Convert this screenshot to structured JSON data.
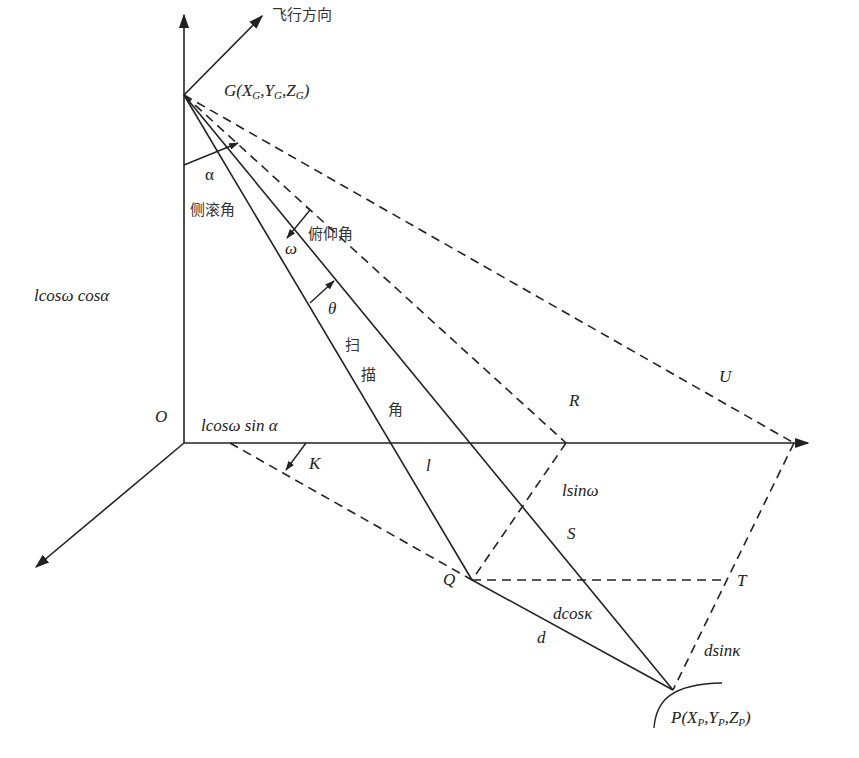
{
  "diagram": {
    "type": "3d-geometry-figure",
    "labels": {
      "flight_direction": "飞行方向",
      "point_G": "G(X",
      "G_sub_x": "G",
      "G_y": ",Y",
      "G_sub_y": "G",
      "G_z": ",Z",
      "G_sub_z": "G",
      "G_close": ")",
      "alpha": "α",
      "roll_angle": "侧滚角",
      "pitch_angle": "俯仰角",
      "omega": "ω",
      "theta": "θ",
      "scan_1": "扫",
      "scan_2": "描",
      "scan_3": "角",
      "vertical_len": "lcosω cosα",
      "origin": "O",
      "horizontal_len": "lcosω sin α",
      "K": "K",
      "l": "l",
      "R": "R",
      "U": "U",
      "lsin_omega": "lsinω",
      "S": "S",
      "Q": "Q",
      "T": "T",
      "dcos_kappa": "dcosκ",
      "d": "d",
      "dsin_kappa": "dsinκ",
      "point_P": "P(X",
      "P_sub_x": "P",
      "P_y": ",Y",
      "P_sub_y": "P",
      "P_z": ",Z",
      "P_sub_z": "P",
      "P_close": ")"
    },
    "points": {
      "G": [
        184,
        95
      ],
      "O": [
        184,
        443
      ],
      "x_axis_end": [
        808,
        443
      ],
      "z_axis_end": [
        184,
        15
      ],
      "y_axis_end": [
        35,
        568
      ],
      "flight_arrow_end": [
        262,
        15
      ],
      "R_foot": [
        566,
        443
      ],
      "U_foot": [
        794,
        443
      ],
      "Q": [
        472,
        580
      ],
      "T": [
        723,
        580
      ],
      "P": [
        673,
        690
      ],
      "K_start": [
        230,
        443
      ]
    },
    "colors": {
      "line": "#222222",
      "text": "#222222"
    }
  },
  "caption": {
    "text": ""
  }
}
